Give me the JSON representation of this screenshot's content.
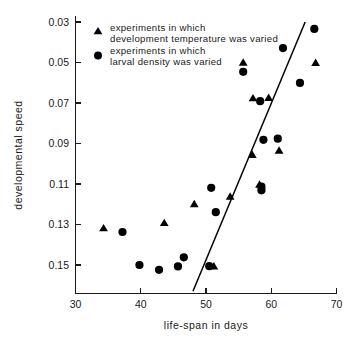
{
  "chart_data": {
    "type": "scatter",
    "title": "",
    "xlabel": "life-span in days",
    "ylabel": "developmental speed",
    "xlim": [
      30,
      70
    ],
    "ylim": [
      0.03,
      0.16
    ],
    "y_inverted": true,
    "grid": false,
    "xticks": [
      30,
      40,
      50,
      60,
      70
    ],
    "xtick_labels": [
      "30",
      "40",
      "50",
      "60",
      "70"
    ],
    "yticks": [
      0.03,
      0.05,
      0.07,
      0.09,
      0.11,
      0.13,
      0.15
    ],
    "ytick_labels": [
      "0.03",
      "0.05",
      "0.07",
      "0.09",
      "0.11",
      "0.13",
      "0.15"
    ],
    "legend_position": "upper-left",
    "series": [
      {
        "name": "experiments in which development temperature was varied",
        "marker": "triangle",
        "color": "#000000",
        "points": [
          {
            "x": 34.3,
            "y": 0.1318
          },
          {
            "x": 43.6,
            "y": 0.1292
          },
          {
            "x": 48.2,
            "y": 0.1199
          },
          {
            "x": 51.2,
            "y": 0.1506
          },
          {
            "x": 53.7,
            "y": 0.1162
          },
          {
            "x": 55.7,
            "y": 0.05
          },
          {
            "x": 57.1,
            "y": 0.0956
          },
          {
            "x": 57.2,
            "y": 0.0676
          },
          {
            "x": 58.2,
            "y": 0.1102
          },
          {
            "x": 59.6,
            "y": 0.0674
          },
          {
            "x": 61.2,
            "y": 0.0935
          },
          {
            "x": 66.8,
            "y": 0.0501
          }
        ]
      },
      {
        "name": "experiments in which larval density was varied",
        "marker": "circle",
        "color": "#000000",
        "points": [
          {
            "x": 37.2,
            "y": 0.1337
          },
          {
            "x": 39.8,
            "y": 0.15
          },
          {
            "x": 42.8,
            "y": 0.1524
          },
          {
            "x": 45.7,
            "y": 0.1507
          },
          {
            "x": 46.6,
            "y": 0.1462
          },
          {
            "x": 50.5,
            "y": 0.1506
          },
          {
            "x": 50.8,
            "y": 0.1119
          },
          {
            "x": 51.5,
            "y": 0.1239
          },
          {
            "x": 55.7,
            "y": 0.0546
          },
          {
            "x": 58.3,
            "y": 0.0691
          },
          {
            "x": 58.5,
            "y": 0.1113
          },
          {
            "x": 58.5,
            "y": 0.1131
          },
          {
            "x": 58.8,
            "y": 0.0882
          },
          {
            "x": 61.0,
            "y": 0.0876
          },
          {
            "x": 61.8,
            "y": 0.0429
          },
          {
            "x": 64.4,
            "y": 0.0601
          },
          {
            "x": 66.6,
            "y": 0.0334
          }
        ]
      }
    ],
    "fit_line": {
      "name": "regression-line",
      "x_start": 48.0,
      "y_start": 0.163,
      "x_end": 65.2,
      "y_end": 0.03
    }
  },
  "legend": {
    "entries": [
      {
        "marker": "triangle",
        "line1": "experiments in which",
        "line2": "development temperature was varied"
      },
      {
        "marker": "circle",
        "line1": "experiments in which",
        "line2": "larval density was varied"
      }
    ]
  },
  "axes": {
    "x_title": "life-span in days",
    "y_title": "developmental speed",
    "x_labels": [
      "30",
      "40",
      "50",
      "60",
      "70"
    ],
    "y_labels": [
      "0.03",
      "0.05",
      "0.07",
      "0.09",
      "0.11",
      "0.13",
      "0.15"
    ]
  },
  "colors": {
    "marker": "#000000",
    "axis": "#1a1a1a",
    "background": "#ffffff",
    "fit_line": "#000000"
  }
}
